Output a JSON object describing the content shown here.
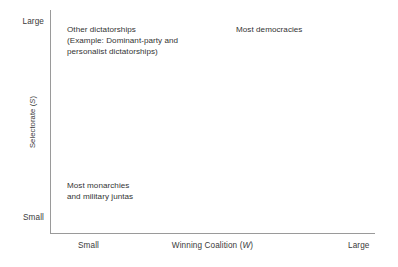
{
  "chart_data": {
    "type": "scatter",
    "title": "",
    "xlabel": "Winning Coalition (W)",
    "ylabel": "Selectorate (S)",
    "x_ticks": [
      "Small",
      "Large"
    ],
    "y_ticks": [
      "Large",
      "Small"
    ],
    "xlim": [
      "Small",
      "Large"
    ],
    "ylim": [
      "Small",
      "Large"
    ],
    "grid": false,
    "legend": "none",
    "axis_color": "#9a9a9a",
    "text_color": "#333333",
    "background": "#ffffff",
    "annotations": [
      {
        "id": "other-dictatorships",
        "text": "Other dictatorships\n(Example: Dominant-party and\npersonalist dictatorships)",
        "x": "small-W",
        "y": "large-S"
      },
      {
        "id": "most-democracies",
        "text": "Most democracies",
        "x": "large-W",
        "y": "large-S"
      },
      {
        "id": "most-monarchies",
        "text": "Most monarchies\nand military juntas",
        "x": "small-W",
        "y": "small-S"
      }
    ]
  },
  "axes": {
    "y": {
      "title_prefix": "Selectorate (",
      "title_italic": "S",
      "title_suffix": ")",
      "tick_top": "Large",
      "tick_bottom": "Small"
    },
    "x": {
      "title_prefix": "Winning Coalition (",
      "title_italic": "W",
      "title_suffix": ")",
      "tick_left": "Small",
      "tick_right": "Large"
    }
  },
  "annotations": {
    "other_dictatorships": "Other dictatorships\n(Example: Dominant-party and\npersonalist dictatorships)",
    "most_democracies": "Most democracies",
    "most_monarchies": "Most monarchies\nand military juntas"
  }
}
